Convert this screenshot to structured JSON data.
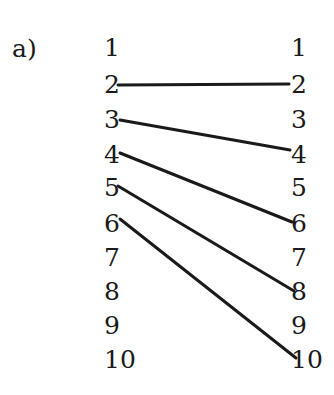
{
  "label": "a)",
  "left_column": [
    "1",
    "2",
    "3",
    "4",
    "5",
    "6",
    "7",
    "8",
    "9",
    "10"
  ],
  "right_column": [
    "1",
    "2",
    "3",
    "4",
    "5",
    "6",
    "7",
    "8",
    "9",
    "10"
  ],
  "mappings": [
    {
      "from": "2",
      "to": "2"
    },
    {
      "from": "3",
      "to": "4"
    },
    {
      "from": "4",
      "to": "6"
    },
    {
      "from": "5",
      "to": "8"
    },
    {
      "from": "6",
      "to": "10"
    }
  ],
  "colors": {
    "ink": "#1a1a1a",
    "background": "#ffffff"
  }
}
